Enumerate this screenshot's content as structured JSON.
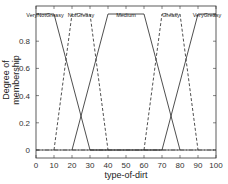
{
  "chart_data": {
    "type": "line",
    "title": "",
    "xlabel": "type-of-dirt",
    "ylabel": "Degree of membership",
    "xlim": [
      0,
      100
    ],
    "ylim": [
      -0.05,
      1.05
    ],
    "xticks": [
      0,
      10,
      20,
      30,
      40,
      50,
      60,
      70,
      80,
      90,
      100
    ],
    "yticks": [
      0,
      0.2,
      0.4,
      0.6,
      0.8,
      1
    ],
    "ytick_labels": [
      "0",
      "0.2",
      "0.4",
      "0.6",
      "0.8",
      ""
    ],
    "grid": false,
    "legend": "labels-at-peaks",
    "series": [
      {
        "name": "VeryNotGreasy",
        "style": "solid",
        "x": [
          0,
          10,
          30,
          100
        ],
        "y": [
          1,
          1,
          0,
          0
        ]
      },
      {
        "name": "NotGreasy",
        "style": "dashed",
        "x": [
          10,
          20,
          30,
          40
        ],
        "y": [
          0,
          1,
          1,
          0
        ]
      },
      {
        "name": "Medium",
        "style": "solid",
        "x": [
          20,
          40,
          60,
          80
        ],
        "y": [
          0,
          1,
          1,
          0
        ]
      },
      {
        "name": "Greasy",
        "style": "dashed",
        "x": [
          60,
          70,
          80,
          90
        ],
        "y": [
          0,
          1,
          1,
          0
        ]
      },
      {
        "name": "VeryGreasy",
        "style": "solid",
        "x": [
          0,
          70,
          90,
          100
        ],
        "y": [
          0,
          0,
          1,
          1
        ]
      }
    ],
    "baseline": {
      "style": "dashdot",
      "y": 0
    }
  }
}
